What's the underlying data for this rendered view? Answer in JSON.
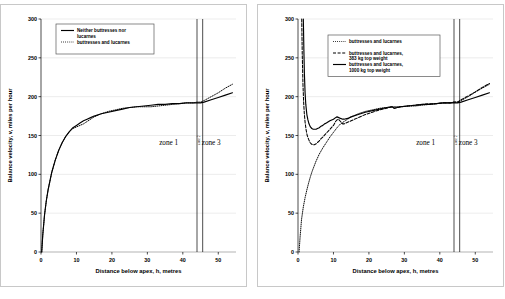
{
  "figure": {
    "panels": [
      "left",
      "right"
    ],
    "background": "#ffffff",
    "panel_border": "#c8c8c8"
  },
  "chart_data": [
    {
      "type": "line",
      "panel": "left",
      "title": "",
      "xlabel": "Distance below apex, h, metres",
      "ylabel": "Balance velocity, v, miles per hour",
      "xlim": [
        0,
        55
      ],
      "ylim": [
        0,
        300
      ],
      "xticks": [
        0,
        10,
        20,
        30,
        40,
        50
      ],
      "yticks": [
        0,
        50,
        100,
        150,
        200,
        250,
        300
      ],
      "grid": true,
      "legend_position": "top-left",
      "series": [
        {
          "name": "Neither buttresses nor lucarnes",
          "style": "solid",
          "color": "#000000",
          "x": [
            0.2,
            0.5,
            1,
            1.5,
            2,
            3,
            4,
            5,
            6,
            7,
            8,
            9,
            10,
            11,
            12,
            13,
            14,
            15,
            17,
            19,
            21,
            23,
            25,
            27,
            29,
            31,
            33,
            35,
            37,
            39,
            41,
            43,
            44,
            45,
            46,
            48,
            50,
            52,
            54
          ],
          "y": [
            0,
            22,
            48,
            66,
            80,
            102,
            118,
            131,
            141,
            149,
            155,
            160,
            163,
            166,
            169,
            171,
            173,
            175,
            178,
            180,
            182,
            184,
            186,
            187,
            188,
            189,
            190,
            190,
            191,
            191,
            192,
            192,
            192,
            192,
            193,
            196,
            199,
            202,
            205
          ]
        },
        {
          "name": "buttresses and lucarnes",
          "style": "dotted",
          "color": "#000000",
          "x": [
            0.2,
            0.5,
            1,
            1.5,
            2,
            3,
            4,
            5,
            6,
            7,
            8,
            9,
            10,
            11,
            12,
            13,
            14,
            15,
            17,
            19,
            21,
            23,
            25,
            27,
            29,
            31,
            33,
            35,
            37,
            39,
            41,
            43,
            44,
            45,
            46,
            48,
            50,
            52,
            54
          ],
          "y": [
            0,
            22,
            48,
            66,
            80,
            102,
            118,
            131,
            141,
            149,
            155,
            159,
            161,
            163,
            165,
            168,
            171,
            174,
            178,
            181,
            183,
            185,
            186,
            187,
            187,
            187,
            188,
            189,
            190,
            191,
            192,
            192,
            193,
            193,
            195,
            200,
            205,
            211,
            216
          ]
        }
      ],
      "zones": [
        {
          "label": "zone 1",
          "orientation": "horizontal",
          "x": 36
        },
        {
          "label": "zone 2",
          "orientation": "vertical",
          "x": 44.8
        },
        {
          "label": "zone 3",
          "orientation": "horizontal",
          "x": 48
        }
      ],
      "zone_lines": [
        44.0,
        45.6
      ]
    },
    {
      "type": "line",
      "panel": "right",
      "title": "",
      "xlabel": "Distance below apex, h, metres",
      "ylabel": "Balance velocity, v, miles per hour",
      "xlim": [
        0,
        55
      ],
      "ylim": [
        0,
        300
      ],
      "xticks": [
        0,
        10,
        20,
        30,
        40,
        50
      ],
      "yticks": [
        0,
        50,
        100,
        150,
        200,
        250,
        300
      ],
      "grid": true,
      "legend_position": "top-center",
      "series": [
        {
          "name": "buttresses and lucarnes",
          "style": "dotted",
          "color": "#000000",
          "x": [
            0.3,
            0.6,
            1,
            1.5,
            2,
            2.5,
            3,
            3.5,
            4,
            5,
            6,
            7,
            8,
            9,
            10,
            11,
            12,
            13,
            14,
            15,
            17,
            19,
            21,
            23,
            25,
            27,
            29,
            31,
            33,
            35,
            37,
            39,
            41,
            43,
            44,
            45,
            46,
            48,
            50,
            52,
            54
          ],
          "y": [
            0,
            20,
            42,
            58,
            70,
            80,
            89,
            97,
            104,
            116,
            126,
            134,
            141,
            148,
            154,
            160,
            165,
            168,
            171,
            174,
            178,
            181,
            183,
            185,
            186,
            187,
            187,
            188,
            188,
            189,
            190,
            191,
            192,
            192,
            193,
            193,
            195,
            200,
            206,
            211,
            216
          ]
        },
        {
          "name": "buttresses and lucarnes, 383 kg top weight",
          "style": "dashed",
          "color": "#000000",
          "x": [
            1.05,
            1.1,
            1.2,
            1.4,
            1.6,
            1.8,
            2,
            2.3,
            2.6,
            3,
            3.4,
            3.8,
            4.2,
            4.6,
            5,
            5.5,
            6,
            6.5,
            7,
            8,
            9,
            10,
            10.6,
            11,
            11.4,
            12,
            12.6,
            13,
            14,
            15,
            17,
            19,
            21,
            23,
            25,
            26.5,
            27.2,
            28,
            29,
            31,
            33,
            35,
            37,
            39,
            41,
            43,
            44,
            45,
            46,
            48,
            50,
            52,
            54
          ],
          "y": [
            300,
            285,
            255,
            216,
            192,
            177,
            167,
            157,
            150,
            145,
            141,
            139,
            138,
            138,
            139,
            141,
            143,
            146,
            148,
            153,
            158,
            163,
            168,
            170,
            171,
            168,
            165,
            165,
            167,
            169,
            173,
            177,
            180,
            183,
            185,
            187,
            185,
            186,
            187,
            188,
            189,
            190,
            191,
            191,
            192,
            192,
            193,
            193,
            196,
            201,
            206,
            212,
            217
          ]
        },
        {
          "name": "buttresses and lucarnes, 1000 kg top weight",
          "style": "solid",
          "color": "#000000",
          "x": [
            1.5,
            1.55,
            1.65,
            1.8,
            2,
            2.2,
            2.5,
            2.8,
            3.1,
            3.5,
            3.9,
            4.3,
            4.7,
            5.1,
            5.5,
            6,
            6.5,
            7,
            7.5,
            8,
            9,
            10,
            10.6,
            11,
            11.5,
            12,
            12.6,
            13,
            14,
            15,
            17,
            19,
            21,
            23,
            25,
            26.5,
            27.2,
            28,
            29,
            31,
            33,
            35,
            37,
            39,
            41,
            43,
            44,
            45,
            46,
            48,
            50,
            52,
            54
          ],
          "y": [
            300,
            288,
            262,
            230,
            205,
            190,
            177,
            170,
            165,
            161,
            159,
            158,
            158,
            158,
            159,
            160,
            162,
            163,
            165,
            166,
            169,
            171,
            173,
            174,
            173,
            172,
            171,
            171,
            172,
            174,
            177,
            180,
            182,
            184,
            186,
            187,
            185,
            186,
            187,
            188,
            189,
            190,
            190,
            191,
            192,
            192,
            192,
            192,
            193,
            196,
            199,
            202,
            205
          ]
        }
      ],
      "zones": [
        {
          "label": "zone 1",
          "orientation": "horizontal",
          "x": 36
        },
        {
          "label": "zone 2",
          "orientation": "vertical",
          "x": 44.8
        },
        {
          "label": "zone 3",
          "orientation": "horizontal",
          "x": 48
        }
      ],
      "zone_lines": [
        44.0,
        45.6
      ]
    }
  ]
}
